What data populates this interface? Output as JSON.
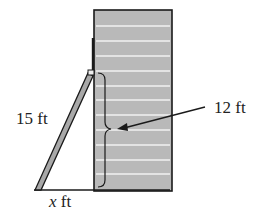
{
  "diagram": {
    "labels": {
      "ladder_length": "15 ft",
      "height": "12 ft",
      "base_variable": "x",
      "base_unit": " ft"
    },
    "colors": {
      "building_fill": "#b9b9b9",
      "building_stripes": "#f2f2f2",
      "outline": "#1a1a1a",
      "ladder_fill": "#a8a8a8"
    },
    "stripe_count": 11
  }
}
